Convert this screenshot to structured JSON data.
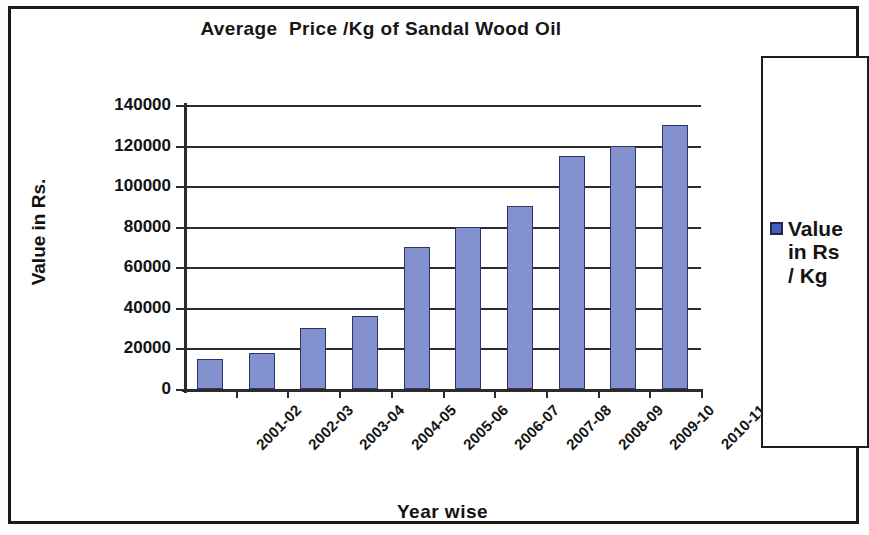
{
  "chart_data": {
    "type": "bar",
    "title": "Average  Price /Kg of Sandal Wood Oil",
    "xlabel": "Year wise",
    "ylabel": "Value in Rs.",
    "categories": [
      "2001-02",
      "2002-03",
      "2003-04",
      "2004-05",
      "2005-06",
      "2006-07",
      "2007-08",
      "2008-09",
      "2009-10",
      "2010-11"
    ],
    "values": [
      15000,
      18000,
      30000,
      36000,
      70000,
      80000,
      90000,
      115000,
      120000,
      130000
    ],
    "series": [
      {
        "name": "Value in Rs / Kg",
        "values": [
          15000,
          18000,
          30000,
          36000,
          70000,
          80000,
          90000,
          115000,
          120000,
          130000
        ]
      }
    ],
    "ylim": [
      0,
      140000
    ],
    "ytick_labels": [
      "140000",
      "120000",
      "100000",
      "80000",
      "60000",
      "40000",
      "20000",
      "0"
    ],
    "ytick_values": [
      140000,
      120000,
      100000,
      80000,
      60000,
      40000,
      20000,
      0
    ],
    "grid": true,
    "legend_position": "right",
    "bar_color": "#8491cf",
    "bar_border_color": "#2e3566"
  },
  "legend": {
    "label": "Value\nin Rs\n/ Kg",
    "swatch_color": "#4a5bbf"
  }
}
